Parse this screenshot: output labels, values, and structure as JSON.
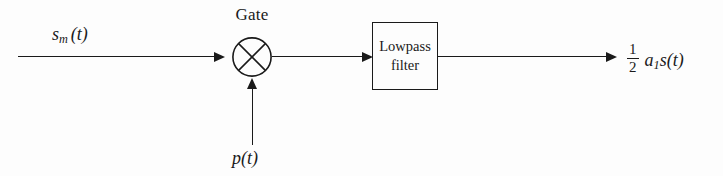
{
  "diagram": {
    "type": "signal-flow-block-diagram",
    "stroke_color": "#1a1a1a",
    "background_color": "#fdfdfd",
    "nodes": {
      "gate": {
        "label": "Gate",
        "symbol": "circle-with-x",
        "operation": "multiplier"
      },
      "filter": {
        "line1": "Lowpass",
        "line2": "filter",
        "shape": "rectangle"
      }
    },
    "signals": {
      "input": {
        "base": "s",
        "subscript": "m",
        "arg": "(t)",
        "plain": "s_m(t)"
      },
      "pulse": {
        "base": "p",
        "arg": "(t)",
        "plain": "p(t)"
      },
      "output": {
        "fraction_numerator": "1",
        "fraction_denominator": "2",
        "coefficient_base": "a",
        "coefficient_subscript": "1",
        "signal_base": "s",
        "signal_arg": "(t)",
        "plain": "1/2 a_1 s(t)"
      }
    }
  }
}
